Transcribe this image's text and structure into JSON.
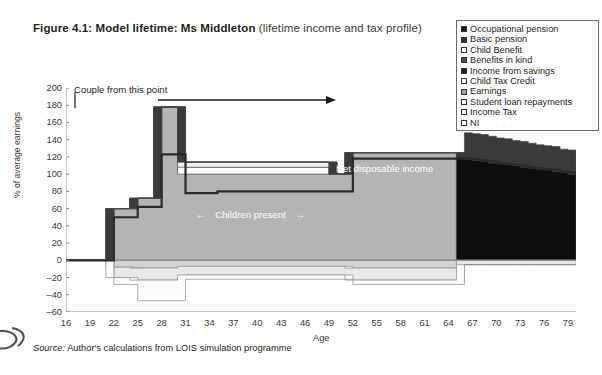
{
  "figure": {
    "number": "Figure 4.1:",
    "title_bold": "Model lifetime: Ms Middleton",
    "title_regular": "(lifetime income and tax profile)"
  },
  "source": {
    "label": "Source:",
    "text": "Author's calculations from LOIS simulation programme"
  },
  "annotations": {
    "couple": "Couple from this point",
    "children": "Children present",
    "children_left_arrow": "←",
    "children_right_arrow": "→",
    "net_disposable_income": "Net disposable income"
  },
  "colors": {
    "occupational_pension": "#0d0d0d",
    "basic_pension": "#3a3a3a",
    "child_benefit": "#ffffff",
    "benefits_in_kind": "#4f4f4f",
    "income_from_savings": "#2b2b2b",
    "child_tax_credit": "#f2f2f2",
    "earnings": "#b4b4b4",
    "student_loan_repayments": "#fbfbfb",
    "income_tax": "#e8e8e8",
    "ni": "#d4d4d4",
    "net_line": "#2a2a2a",
    "axis": "#8a8a8a"
  },
  "legend": {
    "items": [
      {
        "label": "Occupational pension",
        "swatch": "#111111"
      },
      {
        "label": "Basic pension",
        "swatch": "#2f2f2f"
      },
      {
        "label": "Child Benefit",
        "swatch": "#ffffff"
      },
      {
        "label": "Benefits in kind",
        "swatch": "#4a4a4a"
      },
      {
        "label": "Income from savings",
        "swatch": "#1f1f1f"
      },
      {
        "label": "Child Tax Credit",
        "swatch": "#ffffff"
      },
      {
        "label": "Earnings",
        "swatch": "#9a9a9a"
      },
      {
        "label": "Student loan repayments",
        "swatch": "#ffffff"
      },
      {
        "label": "Income Tax",
        "swatch": "#ffffff"
      },
      {
        "label": "NI",
        "swatch": "#ffffff"
      }
    ]
  },
  "chart_data": {
    "type": "area",
    "title": "Model lifetime: Ms Middleton (lifetime income and tax profile)",
    "xlabel": "Age",
    "ylabel": "% of average earnings",
    "xlim": [
      16,
      80
    ],
    "ylim": [
      -60,
      200
    ],
    "xticks": [
      16,
      19,
      22,
      25,
      28,
      31,
      34,
      37,
      40,
      43,
      46,
      49,
      52,
      55,
      58,
      61,
      64,
      67,
      70,
      73,
      76,
      79
    ],
    "yticks": [
      -60,
      -40,
      -20,
      0,
      20,
      40,
      60,
      80,
      100,
      120,
      140,
      160,
      180,
      200
    ],
    "grid": false,
    "legend_position": "top-right",
    "x": [
      16,
      17,
      18,
      19,
      20,
      21,
      22,
      23,
      24,
      25,
      26,
      27,
      28,
      29,
      30,
      31,
      32,
      33,
      34,
      35,
      36,
      37,
      38,
      39,
      40,
      41,
      42,
      43,
      44,
      45,
      46,
      47,
      48,
      49,
      50,
      51,
      52,
      53,
      54,
      55,
      56,
      57,
      58,
      59,
      60,
      61,
      62,
      63,
      64,
      65,
      66,
      67,
      68,
      69,
      70,
      71,
      72,
      73,
      74,
      75,
      76,
      77,
      78,
      79,
      80
    ],
    "series": [
      {
        "name": "Earnings",
        "values": [
          0,
          0,
          0,
          0,
          0,
          0,
          60,
          60,
          60,
          72,
          72,
          72,
          178,
          178,
          178,
          100,
          100,
          100,
          100,
          100,
          100,
          100,
          100,
          100,
          100,
          100,
          100,
          100,
          100,
          100,
          100,
          100,
          100,
          100,
          100,
          100,
          125,
          125,
          125,
          125,
          125,
          125,
          125,
          125,
          125,
          125,
          125,
          125,
          125,
          125,
          0,
          0,
          0,
          0,
          0,
          0,
          0,
          0,
          0,
          0,
          0,
          0,
          0,
          0,
          0
        ]
      },
      {
        "name": "Child Benefit",
        "values": [
          0,
          0,
          0,
          0,
          0,
          0,
          0,
          0,
          0,
          0,
          0,
          0,
          0,
          0,
          0,
          8,
          8,
          8,
          8,
          8,
          8,
          8,
          8,
          8,
          8,
          8,
          8,
          8,
          8,
          8,
          8,
          8,
          8,
          8,
          0,
          0,
          0,
          0,
          0,
          0,
          0,
          0,
          0,
          0,
          0,
          0,
          0,
          0,
          0,
          0,
          0,
          0,
          0,
          0,
          0,
          0,
          0,
          0,
          0,
          0,
          0,
          0,
          0,
          0,
          0
        ]
      },
      {
        "name": "Child Tax Credit",
        "values": [
          0,
          0,
          0,
          0,
          0,
          0,
          0,
          0,
          0,
          0,
          0,
          0,
          0,
          0,
          0,
          6,
          6,
          6,
          6,
          6,
          6,
          6,
          6,
          6,
          6,
          6,
          6,
          6,
          6,
          6,
          6,
          6,
          6,
          6,
          0,
          0,
          0,
          0,
          0,
          0,
          0,
          0,
          0,
          0,
          0,
          0,
          0,
          0,
          0,
          0,
          0,
          0,
          0,
          0,
          0,
          0,
          0,
          0,
          0,
          0,
          0,
          0,
          0,
          0,
          0
        ]
      },
      {
        "name": "Occupational pension",
        "values": [
          0,
          0,
          0,
          0,
          0,
          0,
          0,
          0,
          0,
          0,
          0,
          0,
          0,
          0,
          0,
          0,
          0,
          0,
          0,
          0,
          0,
          0,
          0,
          0,
          0,
          0,
          0,
          0,
          0,
          0,
          0,
          0,
          0,
          0,
          0,
          0,
          0,
          0,
          0,
          0,
          0,
          0,
          0,
          0,
          0,
          0,
          0,
          0,
          0,
          0,
          118,
          117,
          116,
          115,
          113,
          112,
          111,
          110,
          108,
          107,
          106,
          105,
          103,
          102,
          100
        ]
      },
      {
        "name": "Basic pension",
        "values": [
          0,
          0,
          0,
          0,
          0,
          0,
          0,
          0,
          0,
          0,
          0,
          0,
          0,
          0,
          0,
          0,
          0,
          0,
          0,
          0,
          0,
          0,
          0,
          0,
          0,
          0,
          0,
          0,
          0,
          0,
          0,
          0,
          0,
          0,
          0,
          0,
          0,
          0,
          0,
          0,
          0,
          0,
          0,
          0,
          0,
          0,
          0,
          0,
          0,
          0,
          30,
          30,
          30,
          29,
          29,
          29,
          28,
          28,
          28,
          27,
          27,
          27,
          26,
          26,
          26
        ]
      },
      {
        "name": "Net disposable income",
        "type": "line",
        "values": [
          0,
          0,
          0,
          0,
          0,
          0,
          50,
          50,
          50,
          62,
          62,
          62,
          123,
          123,
          123,
          78,
          78,
          78,
          78,
          80,
          80,
          80,
          80,
          80,
          80,
          80,
          80,
          80,
          80,
          80,
          80,
          80,
          80,
          80,
          80,
          80,
          118,
          118,
          118,
          118,
          118,
          118,
          118,
          118,
          118,
          118,
          118,
          118,
          118,
          118,
          118,
          117,
          116,
          115,
          113,
          112,
          111,
          110,
          108,
          107,
          106,
          105,
          103,
          102,
          100
        ]
      },
      {
        "name": "Income Tax",
        "values": [
          0,
          0,
          0,
          0,
          0,
          0,
          -12,
          -12,
          -12,
          -14,
          -14,
          -14,
          -14,
          -14,
          -14,
          -10,
          -10,
          -10,
          -10,
          -10,
          -10,
          -10,
          -10,
          -10,
          -10,
          -10,
          -10,
          -10,
          -10,
          -10,
          -10,
          -10,
          -10,
          -10,
          -10,
          -10,
          -14,
          -14,
          -14,
          -14,
          -14,
          -14,
          -14,
          -14,
          -14,
          -14,
          -14,
          -14,
          -14,
          -14,
          -5,
          -5,
          -5,
          -5,
          -5,
          -5,
          -5,
          -5,
          -5,
          -5,
          -5,
          -5,
          -5,
          -5,
          -5
        ]
      },
      {
        "name": "NI",
        "values": [
          0,
          0,
          0,
          0,
          0,
          0,
          -8,
          -8,
          -8,
          -9,
          -9,
          -9,
          -9,
          -9,
          -9,
          -7,
          -7,
          -7,
          -7,
          -7,
          -7,
          -7,
          -7,
          -7,
          -7,
          -7,
          -7,
          -7,
          -7,
          -7,
          -7,
          -7,
          -7,
          -7,
          -7,
          -7,
          -9,
          -9,
          -9,
          -9,
          -9,
          -9,
          -9,
          -9,
          -9,
          -9,
          -9,
          -9,
          -9,
          -9,
          0,
          0,
          0,
          0,
          0,
          0,
          0,
          0,
          0,
          0,
          0,
          0,
          0,
          0,
          0
        ]
      },
      {
        "name": "Student loan repayments",
        "values": [
          0,
          0,
          0,
          0,
          0,
          0,
          -8,
          -8,
          -8,
          -24,
          -24,
          -24,
          -24,
          -24,
          -24,
          -5,
          -5,
          -5,
          -5,
          -5,
          -5,
          -5,
          -5,
          -5,
          -5,
          -5,
          -5,
          -5,
          -5,
          -5,
          -5,
          -5,
          -5,
          -5,
          -5,
          -5,
          -5,
          -5,
          -5,
          -5,
          -5,
          -5,
          -5,
          -5,
          -5,
          -5,
          -5,
          -5,
          -5,
          -5,
          0,
          0,
          0,
          0,
          0,
          0,
          0,
          0,
          0,
          0,
          0,
          0,
          0,
          0,
          0
        ]
      }
    ]
  }
}
